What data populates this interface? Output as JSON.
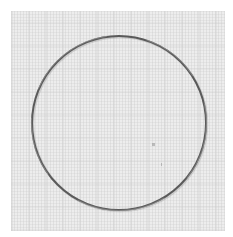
{
  "image": {
    "description": "Thin metal ring photographed on a light grey textured paper background",
    "subject": "metal-ring",
    "background": "textured-paper",
    "colors": {
      "border": "#ffffff",
      "paper": "#ededed",
      "ring_stroke": "#5a5a5a",
      "ring_highlight": "#9a9a9a"
    },
    "ring": {
      "cx": 119,
      "cy": 123,
      "r": 87,
      "stroke_width": 2
    }
  }
}
